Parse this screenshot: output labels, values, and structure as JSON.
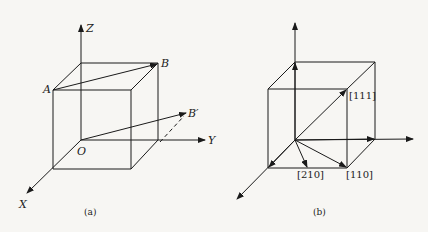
{
  "panel_a": {
    "caption": "(a)",
    "labels": {
      "z": "Z",
      "y": "Y",
      "x": "X",
      "o": "O",
      "a": "A",
      "b": "B",
      "b_prime": "B′"
    }
  },
  "panel_b": {
    "caption": "(b)",
    "labels": {
      "d111": "[111]",
      "d210": "[210]",
      "d110": "[110]"
    }
  },
  "colors": {
    "line": "#1a1a1a",
    "background": "#f7f6f3"
  }
}
